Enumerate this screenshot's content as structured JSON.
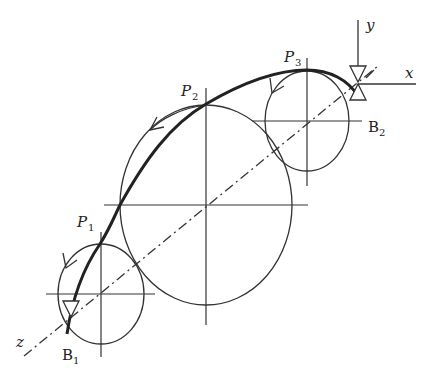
{
  "diagram": {
    "labels": {
      "y_axis": "y",
      "x_axis": "x",
      "z_axis": "z",
      "p1": "P",
      "p1_sub": "1",
      "p2": "P",
      "p2_sub": "2",
      "p3": "P",
      "p3_sub": "3",
      "b1": "B",
      "b1_sub": "1",
      "b2": "B",
      "b2_sub": "2"
    },
    "colors": {
      "stroke": "#222222",
      "background": "#ffffff"
    }
  }
}
